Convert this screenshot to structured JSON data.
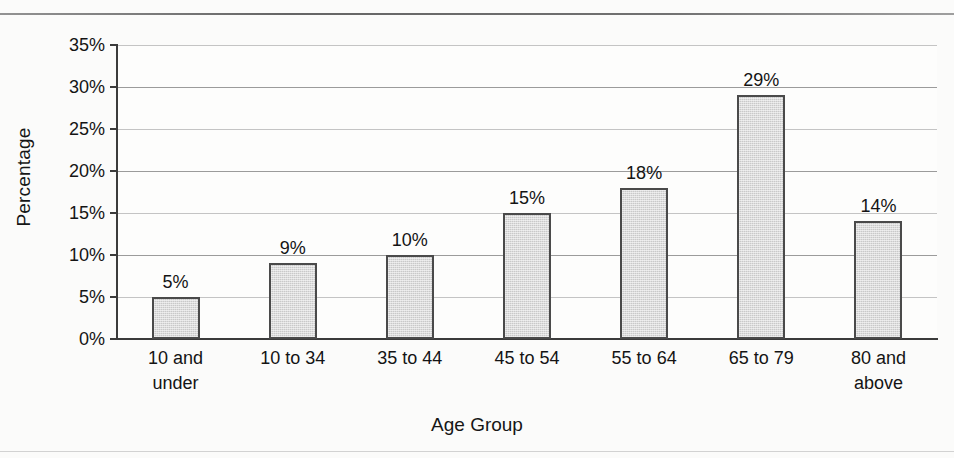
{
  "chart_data": {
    "type": "bar",
    "title": "",
    "xlabel": "Age Group",
    "ylabel": "Percentage",
    "ylim": [
      0,
      35
    ],
    "ytick_step": 5,
    "grid": true,
    "legend": "none",
    "categories": [
      "10 and under",
      "10 to 34",
      "35 to 44",
      "45 to 54",
      "55 to 64",
      "65 to 79",
      "80 and above"
    ],
    "category_lines": [
      [
        "10 and",
        "under"
      ],
      [
        "10 to 34",
        ""
      ],
      [
        "35 to 44",
        ""
      ],
      [
        "45 to 54",
        ""
      ],
      [
        "55 to 64",
        ""
      ],
      [
        "65 to 79",
        ""
      ],
      [
        "80 and",
        "above"
      ]
    ],
    "values": [
      5,
      9,
      10,
      15,
      18,
      29,
      14
    ],
    "value_labels": [
      "5%",
      "9%",
      "10%",
      "15%",
      "18%",
      "29%",
      "14%"
    ],
    "ytick_labels": [
      "0%",
      "5%",
      "10%",
      "15%",
      "20%",
      "25%",
      "30%",
      "35%"
    ],
    "ytick_values": [
      0,
      5,
      10,
      15,
      20,
      25,
      30,
      35
    ],
    "colors": {
      "bar_fill": "#c9c9c9",
      "bar_border": "#4a4a4a",
      "axis": "#3b3b3b",
      "gridline": "#9b9b9b",
      "text": "#141414",
      "background": "#fbfbfa"
    }
  },
  "axes": {
    "y_title": "Percentage",
    "x_title": "Age Group"
  }
}
